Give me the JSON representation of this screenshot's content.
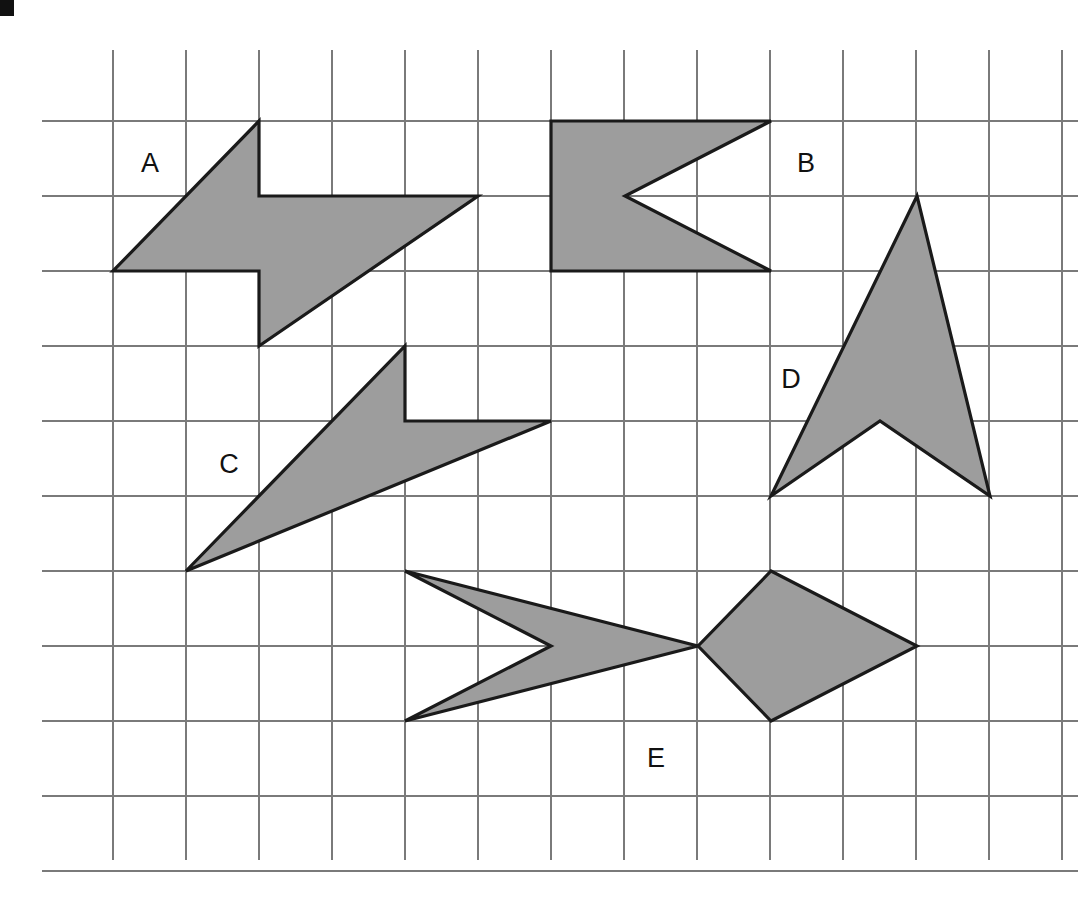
{
  "page": {
    "background_color": "#ffffff",
    "width": 1079,
    "height": 901
  },
  "grid": {
    "line_color": "#7a7a7a",
    "origin_x": 113,
    "origin_y": 121,
    "cell_width": 73,
    "cell_height": 75,
    "columns": 13,
    "rows": 10,
    "vertical_line_top": 50,
    "vertical_line_bottom": 860,
    "horizontal_line_left": 42,
    "horizontal_line_right": 1078
  },
  "style": {
    "shape_fill": "#9d9d9d",
    "shape_stroke": "#1a1a1a",
    "label_color": "#111111"
  },
  "corner_mark": {
    "name": "page-corner-mark",
    "x": 0,
    "y": 0,
    "width": 14,
    "height": 16,
    "color": "#111111"
  },
  "shapes": [
    {
      "id": "A",
      "label": "A",
      "label_x": 150,
      "label_y": 165,
      "description": "Z-shaped lightning / parallelogram with notches",
      "points_px": "259,121 259,196 478,196 259,346 259,271 113,271",
      "grid_points": [
        [
          2,
          0
        ],
        [
          2,
          1
        ],
        [
          5,
          1
        ],
        [
          2,
          3
        ],
        [
          2,
          2
        ],
        [
          0,
          2
        ]
      ]
    },
    {
      "id": "B",
      "label": "B",
      "label_x": 806,
      "label_y": 165,
      "description": "Flag with V notch cut from the right side",
      "points_px": "551,121 771,121 625,196 771,271 551,271",
      "grid_points": [
        [
          6,
          0
        ],
        [
          9,
          0
        ],
        [
          7,
          1
        ],
        [
          9,
          2
        ],
        [
          6,
          2
        ]
      ]
    },
    {
      "id": "C",
      "label": "C",
      "label_x": 229,
      "label_y": 466,
      "description": "Elongated Z-shaped lightning, stretched version of A",
      "points_px": "405,346 405,421 551,421 186,571",
      "grid_points": [
        [
          4,
          3
        ],
        [
          4,
          4
        ],
        [
          6,
          4
        ],
        [
          1,
          6
        ]
      ]
    },
    {
      "id": "D",
      "label": "D",
      "label_x": 791,
      "label_y": 381,
      "description": "Upward pointing arrowhead / chevron",
      "points_px": "917,196 990,496 880,421 771,496",
      "grid_points": [
        [
          11,
          1
        ],
        [
          12,
          5
        ],
        [
          10.5,
          4
        ],
        [
          9,
          5
        ]
      ]
    },
    {
      "id": "E",
      "label": "E",
      "label_x": 656,
      "label_y": 760,
      "description": "Fish / double arrow shape pointing right",
      "points_px": "405,571 698,646 771,571 917,646 771,721 698,646 405,721 551,646",
      "grid_points": [
        [
          4,
          6
        ],
        [
          8,
          7
        ],
        [
          9,
          6
        ],
        [
          11,
          7
        ],
        [
          9,
          8
        ],
        [
          8,
          7
        ],
        [
          4,
          8
        ],
        [
          6,
          7
        ]
      ]
    }
  ],
  "labels": [
    {
      "text": "A",
      "x": 150,
      "y": 165
    },
    {
      "text": "B",
      "x": 806,
      "y": 165
    },
    {
      "text": "C",
      "x": 229,
      "y": 466
    },
    {
      "text": "D",
      "x": 791,
      "y": 381
    },
    {
      "text": "E",
      "x": 656,
      "y": 760
    }
  ]
}
